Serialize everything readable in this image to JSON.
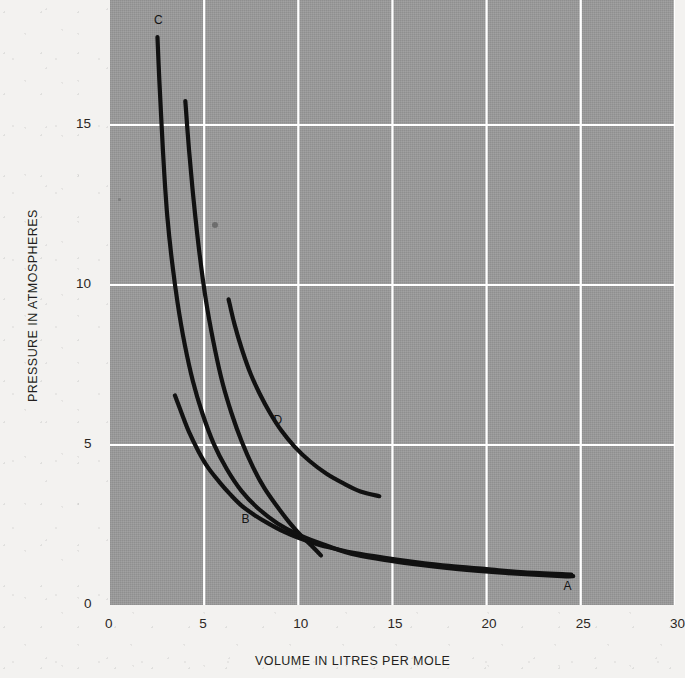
{
  "chart_data": {
    "type": "line",
    "title": "",
    "xlabel": "VOLUME IN LITRES PER MOLE",
    "ylabel": "PRESSURE IN ATMOSPHERES",
    "xlim": [
      0,
      30
    ],
    "ylim": [
      0,
      18.9
    ],
    "xticks": [
      0,
      5,
      10,
      15,
      20,
      25,
      30
    ],
    "xtick_labels": [
      "0",
      "5",
      "10",
      "15",
      "20",
      "25",
      "30"
    ],
    "yticks": [
      0,
      5,
      10,
      15
    ],
    "ytick_labels": [
      "0",
      "5",
      "10",
      "15"
    ],
    "grid": true,
    "grid_color": "#ffffff",
    "plot_bgcolor": "#9b9b9b",
    "line_color": "#111111",
    "legend": "none",
    "annotations": [
      {
        "text": "A",
        "x": 24.3,
        "y": 0.55
      },
      {
        "text": "B",
        "x": 7.2,
        "y": 2.65
      },
      {
        "text": "C",
        "x": 2.55,
        "y": 18.25
      },
      {
        "text": "D",
        "x": 8.9,
        "y": 5.75
      }
    ],
    "series": [
      {
        "name": "A",
        "label": "A",
        "points": [
          [
            3.45,
            6.55
          ],
          [
            3.8,
            6.0
          ],
          [
            4.2,
            5.4
          ],
          [
            4.7,
            4.8
          ],
          [
            5.2,
            4.3
          ],
          [
            5.8,
            3.85
          ],
          [
            6.4,
            3.45
          ],
          [
            7.0,
            3.1
          ],
          [
            7.7,
            2.8
          ],
          [
            8.4,
            2.55
          ],
          [
            9.2,
            2.3
          ],
          [
            10.0,
            2.1
          ],
          [
            11.0,
            1.9
          ],
          [
            12.0,
            1.75
          ],
          [
            13.0,
            1.62
          ],
          [
            14.5,
            1.48
          ],
          [
            16.0,
            1.36
          ],
          [
            18.0,
            1.22
          ],
          [
            20.0,
            1.12
          ],
          [
            22.0,
            1.02
          ],
          [
            24.5,
            0.95
          ]
        ]
      },
      {
        "name": "B",
        "label": "B",
        "points": [
          [
            4.0,
            15.75
          ],
          [
            4.2,
            14.2
          ],
          [
            4.45,
            12.6
          ],
          [
            4.75,
            11.0
          ],
          [
            5.1,
            9.5
          ],
          [
            5.5,
            8.2
          ],
          [
            5.95,
            7.0
          ],
          [
            6.45,
            6.0
          ],
          [
            7.0,
            5.1
          ],
          [
            7.6,
            4.3
          ],
          [
            8.2,
            3.65
          ],
          [
            8.85,
            3.1
          ],
          [
            9.5,
            2.6
          ],
          [
            10.1,
            2.2
          ],
          [
            10.8,
            1.8
          ],
          [
            11.2,
            1.55
          ]
        ]
      },
      {
        "name": "C",
        "label": "C",
        "points": [
          [
            2.52,
            17.75
          ],
          [
            2.62,
            16.4
          ],
          [
            2.74,
            15.0
          ],
          [
            2.88,
            13.5
          ],
          [
            3.05,
            12.1
          ],
          [
            3.3,
            10.7
          ],
          [
            3.6,
            9.4
          ],
          [
            3.95,
            8.2
          ],
          [
            4.4,
            7.0
          ],
          [
            4.9,
            6.0
          ],
          [
            5.5,
            5.05
          ],
          [
            6.2,
            4.25
          ],
          [
            7.0,
            3.55
          ],
          [
            7.9,
            3.0
          ],
          [
            8.9,
            2.55
          ],
          [
            10.0,
            2.2
          ],
          [
            11.3,
            1.9
          ],
          [
            12.8,
            1.6
          ],
          [
            14.5,
            1.42
          ],
          [
            16.5,
            1.25
          ],
          [
            18.5,
            1.12
          ],
          [
            21.0,
            1.0
          ],
          [
            24.0,
            0.9
          ],
          [
            24.6,
            0.9
          ]
        ]
      },
      {
        "name": "D",
        "label": "D",
        "points": [
          [
            6.3,
            9.55
          ],
          [
            6.6,
            8.8
          ],
          [
            7.0,
            8.0
          ],
          [
            7.45,
            7.25
          ],
          [
            7.95,
            6.6
          ],
          [
            8.5,
            6.0
          ],
          [
            9.1,
            5.45
          ],
          [
            9.8,
            4.95
          ],
          [
            10.6,
            4.5
          ],
          [
            11.5,
            4.1
          ],
          [
            12.4,
            3.8
          ],
          [
            13.3,
            3.55
          ],
          [
            14.3,
            3.4
          ]
        ]
      }
    ]
  },
  "plot_geometry": {
    "left": 110,
    "top": 0,
    "width": 565,
    "height": 605,
    "x_px_per_unit": 18.83,
    "y_px_per_unit": 32.0,
    "y_zero_px": 605
  }
}
